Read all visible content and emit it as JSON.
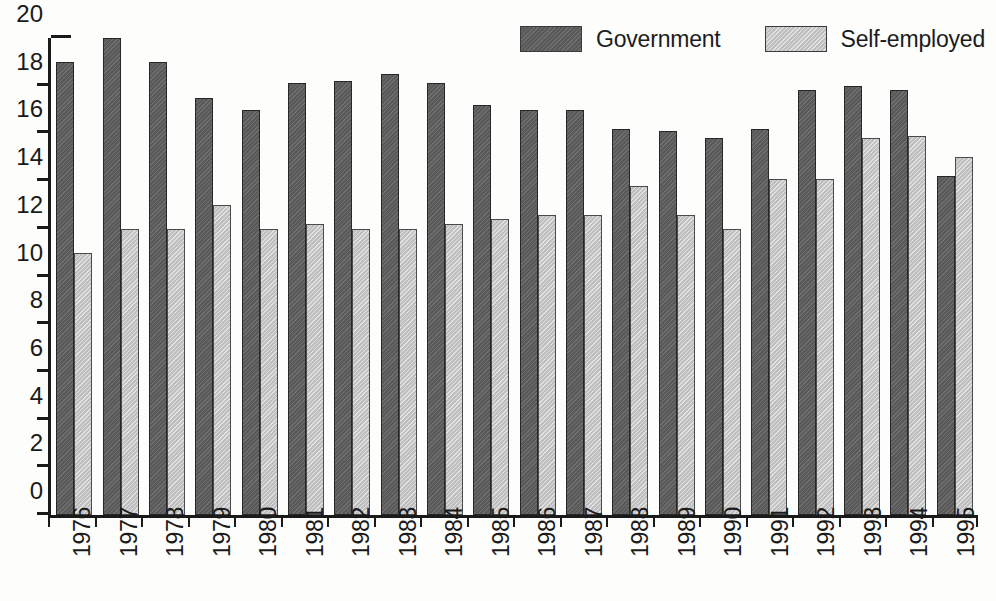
{
  "chart_data": {
    "type": "bar",
    "title": "",
    "subtitle": "",
    "xlabel": "",
    "ylabel": "",
    "ylim": [
      0,
      20
    ],
    "ytick_step": 2,
    "yticks": [
      "0",
      "2",
      "4",
      "6",
      "8",
      "10",
      "12",
      "14",
      "16",
      "18",
      "20"
    ],
    "grid": false,
    "legend_position": "top-right",
    "categories": [
      "1976",
      "1977",
      "1978",
      "1979",
      "1980",
      "1981",
      "1982",
      "1983",
      "1984",
      "1985",
      "1986",
      "1987",
      "1988",
      "1989",
      "1990",
      "1991",
      "1992",
      "1993",
      "1994",
      "1995"
    ],
    "series": [
      {
        "name": "Government",
        "color": "#5f5f5f",
        "values": [
          19.0,
          20.0,
          19.0,
          17.5,
          17.0,
          18.1,
          18.2,
          18.5,
          18.1,
          17.2,
          17.0,
          17.0,
          16.2,
          16.1,
          15.8,
          16.2,
          17.8,
          18.0,
          17.8,
          14.2
        ]
      },
      {
        "name": "Self-employed",
        "color": "#c9c9c9",
        "values": [
          11.0,
          12.0,
          12.0,
          13.0,
          12.0,
          12.2,
          12.0,
          12.0,
          12.2,
          12.4,
          12.6,
          12.6,
          13.8,
          12.6,
          12.0,
          14.1,
          14.1,
          15.8,
          15.9,
          15.0
        ]
      }
    ]
  },
  "legend": {
    "items": [
      {
        "label": "Government",
        "color": "#5f5f5f"
      },
      {
        "label": "Self-employed",
        "color": "#c9c9c9"
      }
    ]
  }
}
